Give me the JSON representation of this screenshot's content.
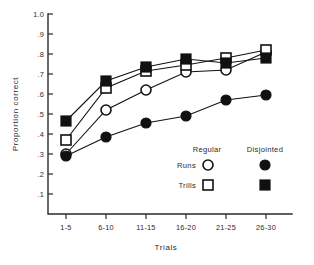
{
  "chart_data": {
    "type": "line",
    "title": "",
    "xlabel": "Trials",
    "ylabel": "Proportion correct",
    "categories": [
      "1-5",
      "6-10",
      "11-15",
      "16-20",
      "21-25",
      "26-30"
    ],
    "ylim": [
      0.0,
      1.0
    ],
    "xlim": [
      0,
      7
    ],
    "ytick_labels": [
      "1.0",
      ".9",
      ".8",
      ".7",
      ".6",
      ".5",
      ".4",
      ".3",
      ".2",
      ".1"
    ],
    "ytick_values": [
      1.0,
      0.9,
      0.8,
      0.7,
      0.6,
      0.5,
      0.4,
      0.3,
      0.2,
      0.1
    ],
    "grid": false,
    "legend_position": "inside-lower-right",
    "series": [
      {
        "name": "Regular Runs",
        "marker": "open-circle",
        "values": [
          0.3,
          0.52,
          0.62,
          0.71,
          0.72,
          0.81
        ]
      },
      {
        "name": "Regular Trills",
        "marker": "open-square",
        "values": [
          0.37,
          0.63,
          0.715,
          0.745,
          0.78,
          0.82
        ]
      },
      {
        "name": "Disjointed Runs",
        "marker": "filled-circle",
        "values": [
          0.29,
          0.385,
          0.455,
          0.49,
          0.57,
          0.595
        ]
      },
      {
        "name": "Disjointed Trills",
        "marker": "filled-square",
        "values": [
          0.465,
          0.665,
          0.735,
          0.775,
          0.755,
          0.78
        ]
      }
    ]
  },
  "legend": {
    "col_regular": "Regular",
    "col_disjointed": "Disjointed",
    "row_runs": "Runs",
    "row_trills": "Trills"
  }
}
